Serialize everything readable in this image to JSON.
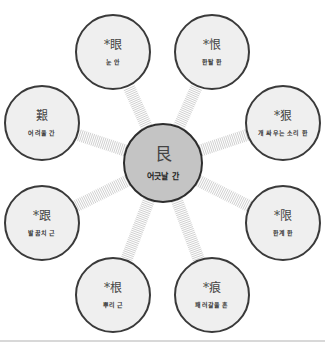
{
  "diagram": {
    "center": {
      "hanja": "艮",
      "reading": "어긋날 간",
      "x": 163,
      "y": 163,
      "r": 40
    },
    "satellites": [
      {
        "hanja": "*眼",
        "reading": "눈 안",
        "x": 113,
        "y": 52
      },
      {
        "hanja": "*恨",
        "reading": "한탈 한",
        "x": 212,
        "y": 52
      },
      {
        "hanja": "*狠",
        "reading": "개 싸우는 소리 한",
        "x": 283,
        "y": 123
      },
      {
        "hanja": "*限",
        "reading": "한계 한",
        "x": 283,
        "y": 223
      },
      {
        "hanja": "*痕",
        "reading": "패러갈을 흔",
        "x": 212,
        "y": 295
      },
      {
        "hanja": "*根",
        "reading": "뿌리 근",
        "x": 113,
        "y": 295
      },
      {
        "hanja": "*跟",
        "reading": "발꿈치 근",
        "x": 42,
        "y": 223
      },
      {
        "hanja": "艱",
        "reading": "어려울 간",
        "x": 42,
        "y": 123
      }
    ],
    "satellite_radius": 38,
    "colors": {
      "center_fill": "#c4c4c4",
      "satellite_fill": "#efefef",
      "outline": "#333333",
      "connector": "#d0d0d0"
    }
  }
}
